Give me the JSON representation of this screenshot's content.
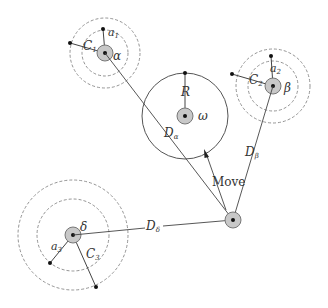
{
  "diagram": {
    "colors": {
      "line": "#444444",
      "dashed": "#888888",
      "node_fill": "#c8c8c8",
      "node_stroke": "#777777",
      "dot": "#111111"
    },
    "nodes": {
      "alpha": {
        "label": "α",
        "inner_label": "a",
        "inner_sub": "1",
        "outer_label": "C",
        "outer_sub": "1"
      },
      "beta": {
        "label": "β",
        "inner_label": "a",
        "inner_sub": "2",
        "outer_label": "C",
        "outer_sub": "2"
      },
      "delta": {
        "label": "δ",
        "inner_label": "a",
        "inner_sub": "3",
        "outer_label": "C",
        "outer_sub": "3"
      },
      "omega": {
        "label": "ω",
        "radius_label": "R"
      }
    },
    "edges": {
      "d_alpha": {
        "label": "D",
        "sub": "α"
      },
      "d_beta": {
        "label": "D",
        "sub": "β"
      },
      "d_delta": {
        "label": "D",
        "sub": "δ"
      }
    },
    "move_label": "Move"
  }
}
